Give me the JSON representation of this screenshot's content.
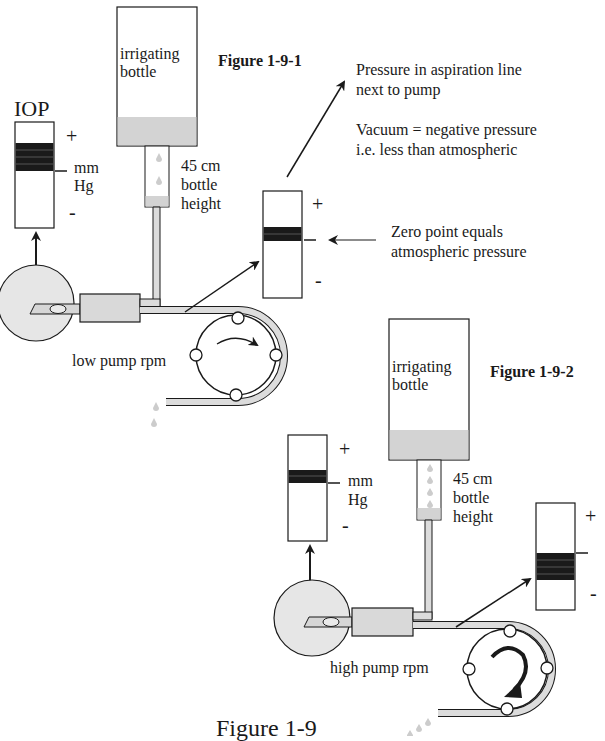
{
  "figure_1": {
    "title": "Figure 1-9-1",
    "iop_label": "IOP",
    "iop_gauge": {
      "plus": "+",
      "minus": "-",
      "units_line1": "mm",
      "units_line2": "Hg"
    },
    "bottle": {
      "line1": "irrigating",
      "line2": "bottle"
    },
    "bottle_height": {
      "line1": "45 cm",
      "line2": "bottle",
      "line3": "height"
    },
    "pump_label": "low pump rpm",
    "aspiration_gauge": {
      "plus": "+",
      "minus": "-"
    },
    "annotation_pressure": {
      "line1": "Pressure in aspiration line",
      "line2": "next to pump"
    },
    "annotation_vacuum": {
      "line1": "Vacuum = negative pressure",
      "line2": "i.e. less than atmospheric"
    },
    "annotation_zero": {
      "line1": "Zero point equals",
      "line2": "atmospheric pressure"
    }
  },
  "figure_2": {
    "title": "Figure 1-9-2",
    "iop_gauge": {
      "plus": "+",
      "minus": "-",
      "units_line1": "mm",
      "units_line2": "Hg"
    },
    "bottle": {
      "line1": "irrigating",
      "line2": "bottle"
    },
    "bottle_height": {
      "line1": "45 cm",
      "line2": "bottle",
      "line3": "height"
    },
    "pump_label": "high pump rpm",
    "aspiration_gauge": {
      "plus": "+",
      "minus": "-"
    }
  },
  "caption": "Figure 1-9",
  "colors": {
    "fluid": "#d3d3d3",
    "eye": "#e6e6e6",
    "tube": "#dcdcdc",
    "bar": "#1a1a1a",
    "line": "#1a1a1a"
  }
}
